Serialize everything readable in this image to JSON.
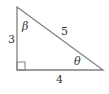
{
  "diagram": {
    "type": "right-triangle",
    "colors": {
      "stroke": "#808080",
      "text": "#333333",
      "background": "#ffffff"
    },
    "sides": {
      "vertical_leg": "3",
      "horizontal_leg": "4",
      "hypotenuse": "5"
    },
    "angles": {
      "top": "β",
      "bottom_right": "θ",
      "right_angle_marker": "bottom-left"
    }
  }
}
